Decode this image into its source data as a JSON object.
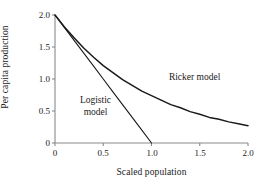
{
  "chart_data": {
    "type": "line",
    "title": "",
    "xlabel": "Scaled population",
    "ylabel": "Per capita production",
    "xlim": [
      0,
      2.0
    ],
    "ylim": [
      0,
      2.0
    ],
    "xticks": [
      "0",
      "0.5",
      "1.0",
      "1.5",
      "2.0"
    ],
    "xtick_values": [
      0,
      0.5,
      1.0,
      1.5,
      2.0
    ],
    "yticks": [
      "0",
      "0.5",
      "1.0",
      "1.5",
      "2.0"
    ],
    "ytick_values": [
      0,
      0.5,
      1.0,
      1.5,
      2.0
    ],
    "grid": false,
    "legend_position": "inline-annotations",
    "axis_color": "#8a8a8a",
    "line_color": "#1a1a1a",
    "series": [
      {
        "name": "Logistic model",
        "label": "Logistic",
        "label2": "model",
        "label_x": 0.42,
        "label_y": 0.62,
        "formula": "2(1 - N)",
        "x": [
          0.0,
          0.1,
          0.2,
          0.3,
          0.4,
          0.5,
          0.6,
          0.7,
          0.8,
          0.9,
          1.0
        ],
        "values": [
          2.0,
          1.8,
          1.6,
          1.4,
          1.2,
          1.0,
          0.8,
          0.6,
          0.4,
          0.2,
          0.0
        ]
      },
      {
        "name": "Ricker model",
        "label": "Ricker model",
        "label_x": 1.18,
        "label_y": 0.98,
        "formula": "2 * exp(-N)",
        "x": [
          0.0,
          0.1,
          0.2,
          0.3,
          0.4,
          0.5,
          0.6,
          0.7,
          0.8,
          0.9,
          1.0,
          1.1,
          1.2,
          1.3,
          1.4,
          1.5,
          1.6,
          1.7,
          1.8,
          1.9,
          2.0
        ],
        "values": [
          2.0,
          1.81,
          1.64,
          1.48,
          1.34,
          1.21,
          1.1,
          0.99,
          0.9,
          0.81,
          0.74,
          0.67,
          0.6,
          0.55,
          0.49,
          0.45,
          0.4,
          0.37,
          0.33,
          0.3,
          0.27
        ]
      }
    ]
  }
}
